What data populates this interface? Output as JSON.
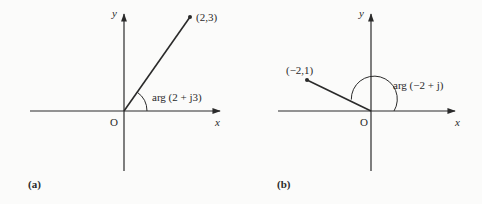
{
  "panels": [
    {
      "id": "a",
      "caption": "(a)",
      "axis_labels": {
        "x": "x",
        "y": "y",
        "origin": "O"
      },
      "point": {
        "label": "(2,3)",
        "re": 2,
        "im": 3
      },
      "angle_label": "arg (2 + j3)"
    },
    {
      "id": "b",
      "caption": "(b)",
      "axis_labels": {
        "x": "x",
        "y": "y",
        "origin": "O"
      },
      "point": {
        "label": "(−2,1)",
        "re": -2,
        "im": 1
      },
      "angle_label": "arg (−2 + j)"
    }
  ],
  "colors": {
    "ink": "#2a2a2a",
    "background": "#fbfbfa"
  }
}
